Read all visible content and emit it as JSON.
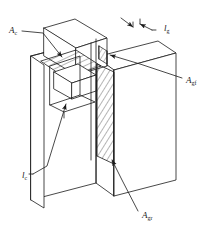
{
  "figure": {
    "background_color": "#ffffff",
    "line_color": "#1a1a1a",
    "hatch_color": "#2a2a2a"
  },
  "labels": {
    "a_c": {
      "text": "A",
      "subscript": "c",
      "meaning": "horizontal hatched shear plane area at top of corbel",
      "x": 9,
      "y": 31
    },
    "a_gf": {
      "text": "A",
      "subscript": "gf",
      "meaning": "front grout / gap interface area",
      "x": 186,
      "y": 81
    },
    "a_gr": {
      "text": "A",
      "subscript": "gr",
      "meaning": "rear grout interface area, vertical hatched plane",
      "x": 142,
      "y": 216
    },
    "l_c": {
      "text": "l",
      "subscript": "c",
      "meaning": "corbel key length dimension",
      "x": 22,
      "y": 176
    },
    "l_g": {
      "text": "l",
      "subscript": "g",
      "meaning": "gap width dimension at top",
      "x": 164,
      "y": 29
    }
  },
  "annotations": {
    "leader_count": 5,
    "arrow_count": 7,
    "hatched_regions": [
      {
        "name": "A_c",
        "orientation": "horizontal-isometric-plane"
      },
      {
        "name": "A_gr",
        "orientation": "vertical-isometric-plane"
      },
      {
        "name": "A_gf",
        "orientation": "narrow-vertical-strip"
      }
    ]
  }
}
